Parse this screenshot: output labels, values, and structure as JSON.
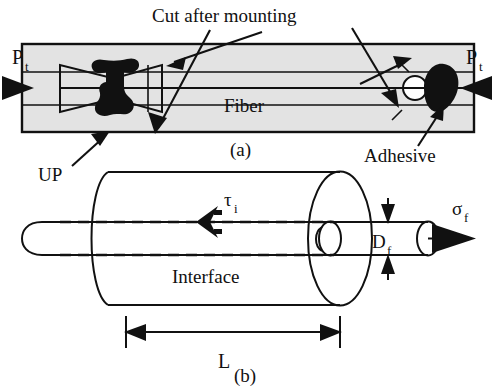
{
  "figure": {
    "panels": [
      {
        "id": "a",
        "caption": "(a)"
      },
      {
        "id": "b",
        "caption": "(b)"
      }
    ]
  },
  "panel_a": {
    "caption": "(a)",
    "load_left_label": "P",
    "load_left_sub": "t",
    "load_right_label": "P",
    "load_right_sub": "t",
    "fiber_label": "Fiber",
    "cut_label": "Cut after mounting",
    "up_label": "UP",
    "adhesive_label": "Adhesive",
    "icons": {
      "left_arrow": "left-load-arrow-icon",
      "right_arrow": "right-load-arrow-icon",
      "bowtie": "bowtie-mount-icon",
      "bone": "up-specimen-icon",
      "droplet": "adhesive-droplet-icon",
      "ring": "fiber-ring-icon"
    }
  },
  "panel_b": {
    "caption": "(b)",
    "shear_label": "τ",
    "shear_sub": "i",
    "interface_label": "Interface",
    "diameter_label": "D",
    "diameter_sub": "f",
    "stress_label": "σ",
    "stress_sub": "f",
    "length_label": "L",
    "icons": {
      "shear_arrow": "shear-stress-arrow-icon",
      "stress_arrow": "fiber-stress-arrow-icon",
      "length_dim": "length-dimension-icon",
      "diameter_dim": "diameter-dimension-icon"
    }
  },
  "colors": {
    "ink": "#111111",
    "panel_fill": "#e3e3e3",
    "paper": "#ffffff"
  }
}
